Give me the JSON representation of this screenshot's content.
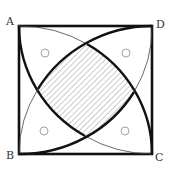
{
  "diagram": {
    "type": "geometry",
    "vertices": {
      "A": {
        "label": "A",
        "position": "top-left"
      },
      "B": {
        "label": "B",
        "position": "bottom-left"
      },
      "C": {
        "label": "C",
        "position": "bottom-right"
      },
      "D": {
        "label": "D",
        "position": "top-right"
      }
    },
    "arcs": [
      {
        "center": "D",
        "from": "A",
        "to": "C",
        "thick_portion": "A to bottom intersection"
      },
      {
        "center": "B",
        "from": "A",
        "to": "C",
        "thick_portion": "top intersection to C"
      },
      {
        "center": "A",
        "from": "B",
        "to": "D",
        "thick_portion": "B to right intersection"
      },
      {
        "center": "C",
        "from": "B",
        "to": "D",
        "thick_portion": "left intersection to D"
      }
    ],
    "shaded_region": {
      "name": "central curvilinear square",
      "fill": "diagonal hatching"
    },
    "markers": [
      {
        "shape": "small-circle",
        "region": "near A"
      },
      {
        "shape": "small-circle",
        "region": "near D"
      },
      {
        "shape": "small-circle",
        "region": "near B"
      },
      {
        "shape": "small-circle",
        "region": "near C"
      }
    ],
    "colors": {
      "line": "#111111",
      "thin_line": "#444444",
      "hatch": "#999999",
      "marker": "#999999",
      "label": "#333333"
    }
  }
}
